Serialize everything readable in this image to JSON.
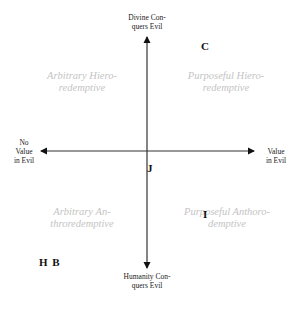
{
  "diagram": {
    "type": "quadrant",
    "axes": {
      "top": {
        "line1": "Divine Con-",
        "line2": "quers Evil"
      },
      "bottom": {
        "line1": "Humanity Con-",
        "line2": "quers Evil"
      },
      "left": {
        "line1": "No",
        "line2": "Value",
        "line3": "in Evil"
      },
      "right": {
        "line1": "Value",
        "line2": "in Evil"
      }
    },
    "quadrants": {
      "top_left": {
        "line1": "Arbitrary Hiero-",
        "line2": "redemptive"
      },
      "top_right": {
        "line1": "Purposeful Hiero-",
        "line2": "redemptive"
      },
      "bottom_left": {
        "line1": "Arbitrary An-",
        "line2": "throredemptive"
      },
      "bottom_right": {
        "line1": "Purposeful Anthoro-",
        "line2": "demptive"
      }
    },
    "markers": {
      "c": "C",
      "j": "J",
      "i": "I",
      "hb": "H B"
    },
    "colors": {
      "axis": "#333333",
      "quadrant_text": "#c4c4c4",
      "marker_text": "#111111"
    }
  }
}
